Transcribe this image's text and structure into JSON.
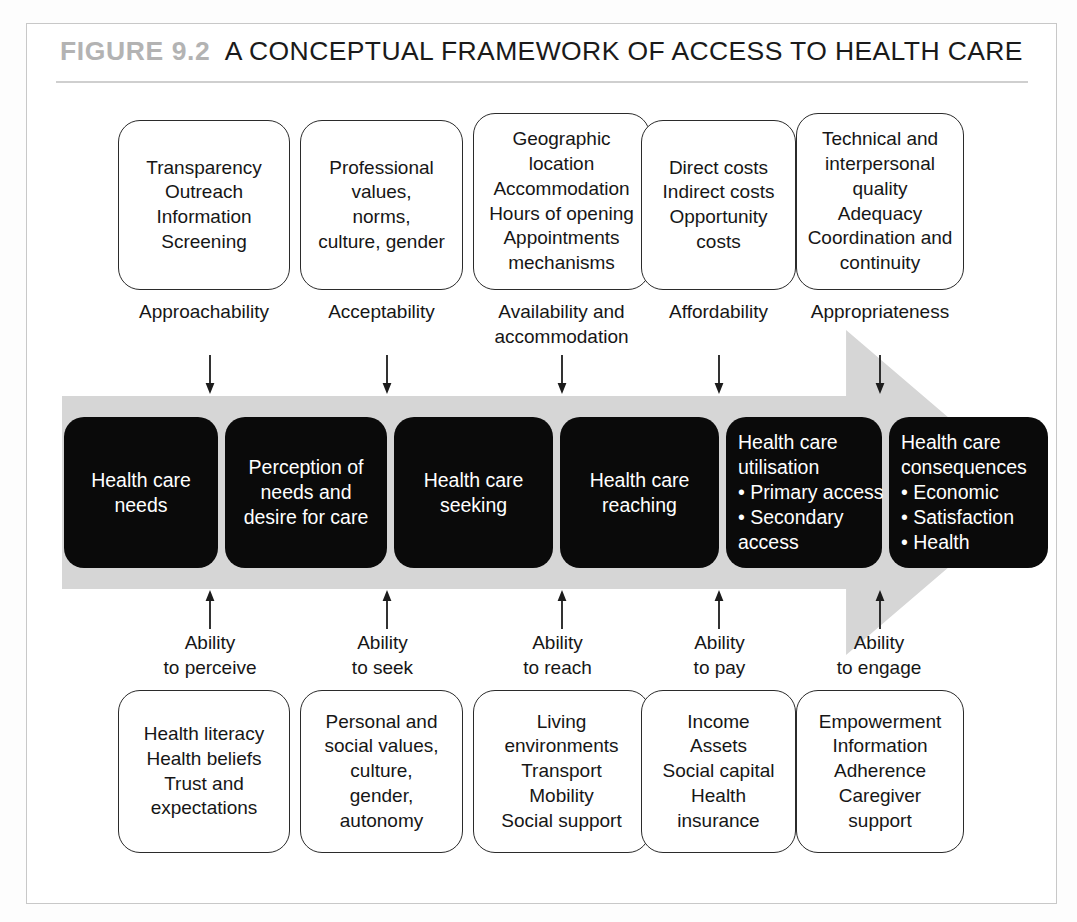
{
  "figure": {
    "label": "FIGURE 9.2",
    "title": "A CONCEPTUAL FRAMEWORK OF ACCESS TO HEALTH CARE",
    "frame_border_color": "#c8c8c8",
    "band_color": "#d6d6d6",
    "box_fill_dark": "#0a0a0a",
    "box_border": "#2b2b2b"
  },
  "supply_side": {
    "boxes": [
      {
        "lines": [
          "Transparency",
          "Outreach",
          "Information",
          "Screening"
        ]
      },
      {
        "lines": [
          "Professional",
          "values,",
          "norms,",
          "culture, gender"
        ]
      },
      {
        "lines": [
          "Geographic",
          "location",
          "Accommodation",
          "Hours of opening",
          "Appointments",
          "mechanisms"
        ]
      },
      {
        "lines": [
          "Direct costs",
          "Indirect costs",
          "Opportunity",
          "costs"
        ]
      },
      {
        "lines": [
          "Technical and",
          "interpersonal",
          "quality",
          "Adequacy",
          "Coordination and",
          "continuity"
        ]
      }
    ],
    "captions": [
      {
        "lines": [
          "Approachability"
        ]
      },
      {
        "lines": [
          "Acceptability"
        ]
      },
      {
        "lines": [
          "Availability and",
          "accommodation"
        ]
      },
      {
        "lines": [
          "Affordability"
        ]
      },
      {
        "lines": [
          "Appropriateness"
        ]
      }
    ]
  },
  "pathway": {
    "steps": [
      {
        "lines": [
          "Health care",
          "needs"
        ],
        "align": "center"
      },
      {
        "lines": [
          "Perception of",
          "needs and",
          "desire for care"
        ],
        "align": "center"
      },
      {
        "lines": [
          "Health care",
          "seeking"
        ],
        "align": "center"
      },
      {
        "lines": [
          "Health care",
          "reaching"
        ],
        "align": "center"
      },
      {
        "lines": [
          "Health care",
          "utilisation",
          "• Primary access",
          "• Secondary",
          "   access"
        ],
        "align": "left"
      },
      {
        "lines": [
          "Health care",
          "consequences",
          "• Economic",
          "• Satisfaction",
          "• Health"
        ],
        "align": "left"
      }
    ]
  },
  "demand_side": {
    "abilities": [
      {
        "lines": [
          "Ability",
          "to perceive"
        ]
      },
      {
        "lines": [
          "Ability",
          "to seek"
        ]
      },
      {
        "lines": [
          "Ability",
          "to reach"
        ]
      },
      {
        "lines": [
          "Ability",
          "to pay"
        ]
      },
      {
        "lines": [
          "Ability",
          "to engage"
        ]
      }
    ],
    "boxes": [
      {
        "lines": [
          "Health literacy",
          "Health beliefs",
          "Trust and",
          "expectations"
        ]
      },
      {
        "lines": [
          "Personal and",
          "social values,",
          "culture,",
          "gender,",
          "autonomy"
        ]
      },
      {
        "lines": [
          "Living",
          "environments",
          "Transport",
          "Mobility",
          "Social support"
        ]
      },
      {
        "lines": [
          "Income",
          "Assets",
          "Social capital",
          "Health",
          "insurance"
        ]
      },
      {
        "lines": [
          "Empowerment",
          "Information",
          "Adherence",
          "Caregiver",
          "support"
        ]
      }
    ]
  }
}
